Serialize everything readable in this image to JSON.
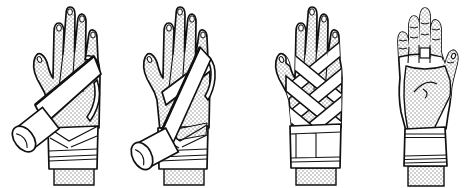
{
  "figure": {
    "panels": [
      {
        "name": "step-1",
        "description": "Back of hand, first diagonal bandage turn from the wrist across the hand, bandage roll at lower left"
      },
      {
        "name": "step-2",
        "description": "Back of hand, second steeper figure-eight turn crossing the first, bandage roll at lower left"
      },
      {
        "name": "step-3",
        "description": "Back of hand covered by completed criss-cross figure-eight wraps with bandaged wrist cuff"
      },
      {
        "name": "step-4",
        "description": "Palm view of finished bandage: wrapped wrist cuff, strip across finger bases, bandage edges along both sides of the palm"
      }
    ],
    "colors": {
      "background": "#ffffff",
      "line": "#111111",
      "bandage": "#ffffff",
      "skin_halftone_dot": "#8c8c8c"
    }
  }
}
